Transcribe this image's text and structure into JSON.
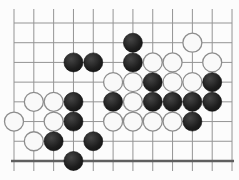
{
  "page": {
    "background_color": "#fcfcfc",
    "width": 239,
    "height": 180
  },
  "board": {
    "type": "go-board-diagram",
    "grid": {
      "cols": 12,
      "rows": 8,
      "x0": 14,
      "y0": 23,
      "col_spacing": 19.82,
      "row_spacing": 19.71,
      "stub_top_y": 9,
      "stub_bottom_y": 171,
      "stone_radius": 9.5
    },
    "colors": {
      "background": "#fcfcfc",
      "grid_line": "#949494",
      "bottom_edge_line": "#5f5f5f",
      "black_stone_dark": "#161616",
      "black_stone_light": "#454545",
      "white_stone_fill": "#f9f9f9",
      "white_stone_border": "#8d8d8d"
    },
    "stones": [
      {
        "col": 6,
        "row": 1,
        "color": "black"
      },
      {
        "col": 9,
        "row": 1,
        "color": "white"
      },
      {
        "col": 3,
        "row": 2,
        "color": "black"
      },
      {
        "col": 4,
        "row": 2,
        "color": "black"
      },
      {
        "col": 6,
        "row": 2,
        "color": "black"
      },
      {
        "col": 7,
        "row": 2,
        "color": "white"
      },
      {
        "col": 8,
        "row": 2,
        "color": "white"
      },
      {
        "col": 10,
        "row": 2,
        "color": "white"
      },
      {
        "col": 5,
        "row": 3,
        "color": "white"
      },
      {
        "col": 6,
        "row": 3,
        "color": "white"
      },
      {
        "col": 7,
        "row": 3,
        "color": "black"
      },
      {
        "col": 8,
        "row": 3,
        "color": "white"
      },
      {
        "col": 9,
        "row": 3,
        "color": "white"
      },
      {
        "col": 10,
        "row": 3,
        "color": "black"
      },
      {
        "col": 1,
        "row": 4,
        "color": "white"
      },
      {
        "col": 2,
        "row": 4,
        "color": "white"
      },
      {
        "col": 3,
        "row": 4,
        "color": "black"
      },
      {
        "col": 5,
        "row": 4,
        "color": "black"
      },
      {
        "col": 6,
        "row": 4,
        "color": "white"
      },
      {
        "col": 7,
        "row": 4,
        "color": "black"
      },
      {
        "col": 8,
        "row": 4,
        "color": "black"
      },
      {
        "col": 9,
        "row": 4,
        "color": "black"
      },
      {
        "col": 10,
        "row": 4,
        "color": "black"
      },
      {
        "col": 0,
        "row": 5,
        "color": "white"
      },
      {
        "col": 2,
        "row": 5,
        "color": "white"
      },
      {
        "col": 3,
        "row": 5,
        "color": "black"
      },
      {
        "col": 5,
        "row": 5,
        "color": "white"
      },
      {
        "col": 6,
        "row": 5,
        "color": "white"
      },
      {
        "col": 7,
        "row": 5,
        "color": "white"
      },
      {
        "col": 8,
        "row": 5,
        "color": "white"
      },
      {
        "col": 9,
        "row": 5,
        "color": "black"
      },
      {
        "col": 1,
        "row": 6,
        "color": "white"
      },
      {
        "col": 2,
        "row": 6,
        "color": "black"
      },
      {
        "col": 4,
        "row": 6,
        "color": "black"
      },
      {
        "col": 3,
        "row": 7,
        "color": "black"
      }
    ]
  }
}
